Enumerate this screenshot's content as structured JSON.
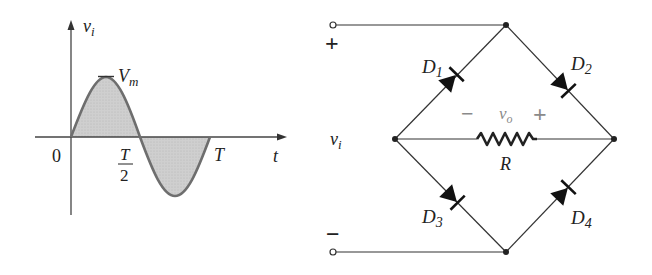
{
  "waveform": {
    "y_axis_label": "v",
    "y_axis_label_sub": "i",
    "x_axis_label": "t",
    "origin_label": "0",
    "half_period_num": "T",
    "half_period_den": "2",
    "period_label": "T",
    "peak_label": "V",
    "peak_label_sub": "m"
  },
  "circuit": {
    "input_label": "v",
    "input_label_sub": "i",
    "plus_terminal": "+",
    "minus_terminal": "−",
    "output_minus": "−",
    "output_label": "v",
    "output_label_sub": "o",
    "output_plus": "+",
    "resistor_label": "R",
    "diodes": [
      {
        "name": "D",
        "sub": "1"
      },
      {
        "name": "D",
        "sub": "2"
      },
      {
        "name": "D",
        "sub": "3"
      },
      {
        "name": "D",
        "sub": "4"
      }
    ]
  },
  "colors": {
    "wire": "#333333",
    "fill": "#c8c8c8",
    "curve": "#6e6e6e",
    "output_polarity": "#8a8a8a"
  }
}
